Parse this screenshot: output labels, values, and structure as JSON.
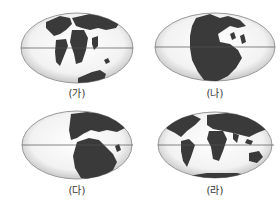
{
  "figure": {
    "colors": {
      "land": "#3a3a3a",
      "ocean_light": "#fafafa",
      "ocean_edge": "#9a9a9a",
      "equator": "#555555",
      "label": "#333333"
    },
    "panels": [
      {
        "id": "ga",
        "label": "(가)",
        "content": "Continents partially separated; Atlantic opening, Africa/S.America apart, India moving north, Antarctica-Australia in south"
      },
      {
        "id": "na",
        "label": "(나)",
        "content": "Supercontinent Pangaea, single landmass centered on left-middle"
      },
      {
        "id": "da",
        "label": "(다)",
        "content": "Pangaea beginning to break up; Laurasia north, Gondwana south"
      },
      {
        "id": "ra",
        "label": "(라)",
        "content": "Present-day continental arrangement"
      }
    ]
  }
}
